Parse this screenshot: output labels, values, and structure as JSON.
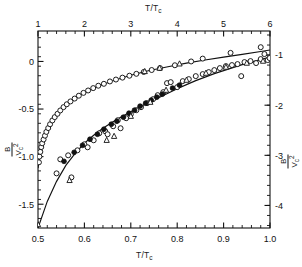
{
  "figure": {
    "top_axis_title": "T/T",
    "top_axis_title_sub": "c",
    "bottom_axis_title": "T/T",
    "bottom_axis_title_sub": "c",
    "left_axis_num": "B",
    "left_axis_den": "V",
    "left_axis_den_sub": "c",
    "left_axis_den_sup": "2",
    "right_axis_num": "B",
    "right_axis_den": "V",
    "right_axis_den_sub": "c",
    "right_axis_den_sup": "2"
  },
  "chart_data": {
    "type": "scatter",
    "title": "",
    "xlabel": "T/Tc",
    "ylabel": "B/Vc^2",
    "grid": false,
    "legend": "none",
    "axes": {
      "bottom": {
        "label": "T/Tc",
        "min": 0.5,
        "max": 1.0,
        "ticks": [
          0.5,
          0.6,
          0.7,
          0.8,
          0.9,
          1.0
        ],
        "ticklabels": [
          "0.5",
          "0.6",
          "0.7",
          "0.8",
          "0.9",
          "1.0"
        ],
        "minor_per_interval": 5
      },
      "top": {
        "label": "T/Tc",
        "min": 1.0,
        "max": 6.0,
        "ticks": [
          1,
          2,
          3,
          4,
          5,
          6
        ],
        "ticklabels": [
          "1",
          "2",
          "3",
          "4",
          "5",
          "6"
        ],
        "minor_per_interval": 5
      },
      "left": {
        "label": "B/Vc^2",
        "min": -1.75,
        "max": 0.32,
        "ticks": [
          0,
          -0.5,
          -1.0,
          -1.5
        ],
        "ticklabels": [
          "0",
          "-0.5",
          "-1.0",
          "-1.5"
        ],
        "minor_per_interval": 5
      },
      "right": {
        "label": "B/Vc^2",
        "min": -4.45,
        "max": -0.52,
        "ticks": [
          -1,
          -2,
          -3,
          -4
        ],
        "ticklabels": [
          "-1",
          "-2",
          "-3",
          "-4"
        ],
        "minor_per_interval": 5
      }
    },
    "series": [
      {
        "name": "upper-branch-open-circles",
        "marker": "open-circle",
        "x_axis": "top",
        "y_axis": "left",
        "points": [
          [
            1.02,
            -1.06
          ],
          [
            1.03,
            -1.0
          ],
          [
            1.05,
            -0.95
          ],
          [
            1.07,
            -0.9
          ],
          [
            1.09,
            -0.86
          ],
          [
            1.12,
            -0.82
          ],
          [
            1.15,
            -0.78
          ],
          [
            1.18,
            -0.74
          ],
          [
            1.22,
            -0.7
          ],
          [
            1.26,
            -0.66
          ],
          [
            1.31,
            -0.62
          ],
          [
            1.36,
            -0.585
          ],
          [
            1.42,
            -0.55
          ],
          [
            1.48,
            -0.515
          ],
          [
            1.55,
            -0.48
          ],
          [
            1.62,
            -0.45
          ],
          [
            1.7,
            -0.42
          ],
          [
            1.79,
            -0.39
          ],
          [
            1.88,
            -0.36
          ],
          [
            1.98,
            -0.33
          ],
          [
            2.08,
            -0.305
          ],
          [
            2.19,
            -0.28
          ],
          [
            2.3,
            -0.255
          ],
          [
            2.42,
            -0.235
          ],
          [
            2.55,
            -0.21
          ],
          [
            2.68,
            -0.19
          ],
          [
            2.82,
            -0.17
          ],
          [
            2.97,
            -0.15
          ],
          [
            3.12,
            -0.13
          ],
          [
            3.28,
            -0.11
          ],
          [
            3.45,
            -0.09
          ],
          [
            3.63,
            -0.07
          ],
          [
            3.95,
            -0.04
          ],
          [
            4.3,
            0.0
          ],
          [
            4.55,
            0.03
          ],
          [
            5.15,
            0.09
          ],
          [
            5.8,
            0.15
          ]
        ]
      },
      {
        "name": "upper-branch-triangles",
        "marker": "triangle",
        "x_axis": "top",
        "y_axis": "left",
        "points": [
          [
            3.3,
            -0.105
          ],
          [
            3.62,
            -0.07
          ],
          [
            4.05,
            -0.025
          ]
        ]
      },
      {
        "name": "lower-branch-open-circles",
        "marker": "open-circle",
        "x_axis": "bottom",
        "y_axis": "right",
        "points": [
          [
            0.54,
            -3.36
          ],
          [
            0.548,
            -3.08
          ],
          [
            0.565,
            -3.0
          ],
          [
            0.572,
            -3.44
          ],
          [
            0.585,
            -2.9
          ],
          [
            0.6,
            -2.78
          ],
          [
            0.607,
            -2.84
          ],
          [
            0.62,
            -2.7
          ],
          [
            0.632,
            -2.56
          ],
          [
            0.645,
            -2.52
          ],
          [
            0.65,
            -2.58
          ],
          [
            0.662,
            -2.42
          ],
          [
            0.672,
            -2.3
          ],
          [
            0.678,
            -2.46
          ],
          [
            0.69,
            -2.26
          ],
          [
            0.7,
            -2.18
          ],
          [
            0.712,
            -2.1
          ],
          [
            0.722,
            -2.04
          ],
          [
            0.735,
            -1.96
          ],
          [
            0.748,
            -1.88
          ],
          [
            0.758,
            -1.8
          ],
          [
            0.77,
            -1.74
          ],
          [
            0.778,
            -1.56
          ],
          [
            0.786,
            -1.54
          ],
          [
            0.8,
            -1.64
          ],
          [
            0.812,
            -1.52
          ],
          [
            0.825,
            -1.48
          ],
          [
            0.84,
            -1.42
          ],
          [
            0.855,
            -1.38
          ],
          [
            0.868,
            -1.34
          ],
          [
            0.88,
            -1.3
          ],
          [
            0.892,
            -1.26
          ],
          [
            0.905,
            -1.22
          ],
          [
            0.918,
            -1.2
          ],
          [
            0.93,
            -1.18
          ],
          [
            0.938,
            -1.42
          ],
          [
            0.945,
            -1.14
          ],
          [
            0.958,
            -1.12
          ],
          [
            0.97,
            -1.16
          ],
          [
            0.98,
            -1.08
          ],
          [
            0.988,
            -0.98
          ],
          [
            0.995,
            -1.1
          ],
          [
            0.999,
            -1.06
          ]
        ]
      },
      {
        "name": "lower-branch-filled-circles",
        "marker": "filled-circle",
        "x_axis": "bottom",
        "y_axis": "right",
        "points": [
          [
            0.556,
            -3.12
          ],
          [
            0.578,
            -2.94
          ],
          [
            0.596,
            -2.8
          ],
          [
            0.612,
            -2.68
          ],
          [
            0.628,
            -2.58
          ],
          [
            0.642,
            -2.48
          ],
          [
            0.658,
            -2.38
          ],
          [
            0.67,
            -2.32
          ],
          [
            0.684,
            -2.24
          ],
          [
            0.696,
            -2.16
          ],
          [
            0.708,
            -2.1
          ],
          [
            0.72,
            -2.02
          ],
          [
            0.732,
            -1.96
          ],
          [
            0.744,
            -1.9
          ],
          [
            0.756,
            -1.84
          ],
          [
            0.768,
            -1.78
          ],
          [
            0.79,
            -1.66
          ],
          [
            0.805,
            -1.6
          ]
        ]
      },
      {
        "name": "lower-branch-triangles",
        "marker": "triangle",
        "x_axis": "bottom",
        "y_axis": "right",
        "points": [
          [
            0.5,
            -4.38
          ],
          [
            0.568,
            -3.5
          ],
          [
            0.648,
            -2.7
          ],
          [
            0.664,
            -2.62
          ],
          [
            0.7,
            -2.22
          ],
          [
            0.742,
            -1.94
          ],
          [
            0.776,
            -1.7
          ],
          [
            0.82,
            -1.5
          ],
          [
            0.862,
            -1.36
          ],
          [
            0.905,
            -1.24
          ],
          [
            0.95,
            -1.16
          ],
          [
            0.985,
            -1.12
          ]
        ]
      }
    ],
    "fit_curves": [
      {
        "name": "upper-fit-line",
        "x_axis": "top",
        "y_axis": "left",
        "points": [
          [
            1.0,
            -1.12
          ],
          [
            1.05,
            -0.96
          ],
          [
            1.1,
            -0.86
          ],
          [
            1.2,
            -0.73
          ],
          [
            1.3,
            -0.63
          ],
          [
            1.45,
            -0.53
          ],
          [
            1.6,
            -0.46
          ],
          [
            1.8,
            -0.385
          ],
          [
            2.0,
            -0.33
          ],
          [
            2.3,
            -0.26
          ],
          [
            2.6,
            -0.205
          ],
          [
            3.0,
            -0.145
          ],
          [
            3.4,
            -0.095
          ],
          [
            3.8,
            -0.055
          ],
          [
            4.2,
            -0.018
          ],
          [
            4.6,
            0.015
          ],
          [
            5.0,
            0.045
          ],
          [
            5.4,
            0.075
          ],
          [
            5.8,
            0.105
          ],
          [
            6.0,
            0.12
          ]
        ]
      },
      {
        "name": "lower-fit-line",
        "x_axis": "bottom",
        "y_axis": "right",
        "points": [
          [
            0.5,
            -4.45
          ],
          [
            0.52,
            -3.92
          ],
          [
            0.54,
            -3.52
          ],
          [
            0.56,
            -3.2
          ],
          [
            0.58,
            -2.96
          ],
          [
            0.6,
            -2.76
          ],
          [
            0.62,
            -2.6
          ],
          [
            0.64,
            -2.46
          ],
          [
            0.66,
            -2.34
          ],
          [
            0.68,
            -2.23
          ],
          [
            0.7,
            -2.13
          ],
          [
            0.72,
            -2.03
          ],
          [
            0.74,
            -1.94
          ],
          [
            0.76,
            -1.85
          ],
          [
            0.78,
            -1.76
          ],
          [
            0.8,
            -1.67
          ],
          [
            0.82,
            -1.59
          ],
          [
            0.84,
            -1.51
          ],
          [
            0.86,
            -1.44
          ],
          [
            0.88,
            -1.37
          ],
          [
            0.9,
            -1.31
          ],
          [
            0.92,
            -1.25
          ],
          [
            0.94,
            -1.19
          ],
          [
            0.96,
            -1.14
          ],
          [
            0.98,
            -1.09
          ],
          [
            1.0,
            -1.04
          ]
        ]
      }
    ]
  }
}
